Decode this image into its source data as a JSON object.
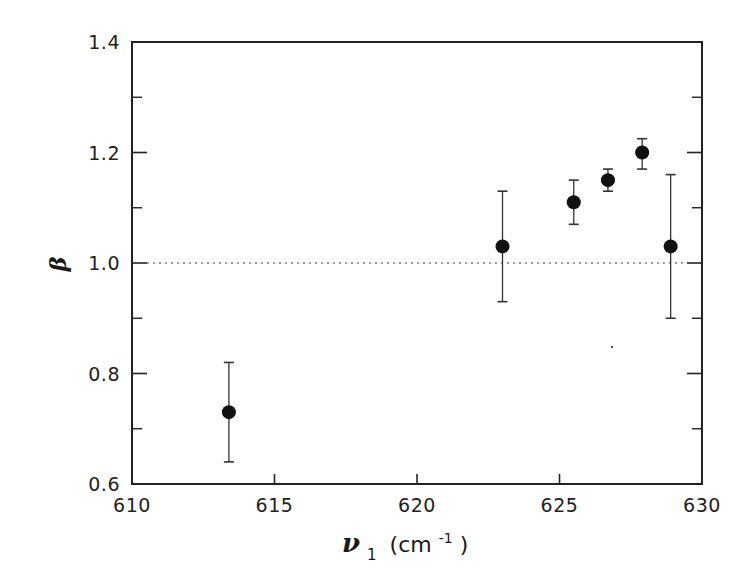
{
  "chart_data": {
    "type": "scatter",
    "title": "",
    "xlabel": "ν1 (cm-1)",
    "xlabel_parts": {
      "symbol": "ν",
      "subscript": "1",
      "unit_open": "(cm",
      "unit_exp": "-1",
      "unit_close": ")"
    },
    "ylabel": "β",
    "xlim": [
      610,
      630
    ],
    "ylim": [
      0.6,
      1.4
    ],
    "x_ticks": [
      610,
      615,
      620,
      625,
      630
    ],
    "x_tick_labels": [
      "610",
      "615",
      "620",
      "625",
      "630"
    ],
    "y_ticks": [
      0.6,
      0.8,
      1.0,
      1.2,
      1.4
    ],
    "y_tick_labels": [
      "0.6",
      "0.8",
      "1.0",
      "1.2",
      "1.4"
    ],
    "y_minor_ticks": [
      0.7,
      0.9,
      1.1,
      1.3
    ],
    "grid": false,
    "legend": null,
    "reference_line": {
      "y": 1.0,
      "style": "dotted"
    },
    "series": [
      {
        "name": "beta",
        "marker": "filled-circle",
        "x": [
          613.4,
          623.0,
          625.5,
          626.7,
          627.9,
          628.9
        ],
        "y": [
          0.73,
          1.03,
          1.11,
          1.15,
          1.2,
          1.03
        ],
        "err_low": [
          0.64,
          0.93,
          1.07,
          1.13,
          1.17,
          0.9
        ],
        "err_high": [
          0.82,
          1.13,
          1.15,
          1.17,
          1.225,
          1.16
        ]
      }
    ]
  }
}
